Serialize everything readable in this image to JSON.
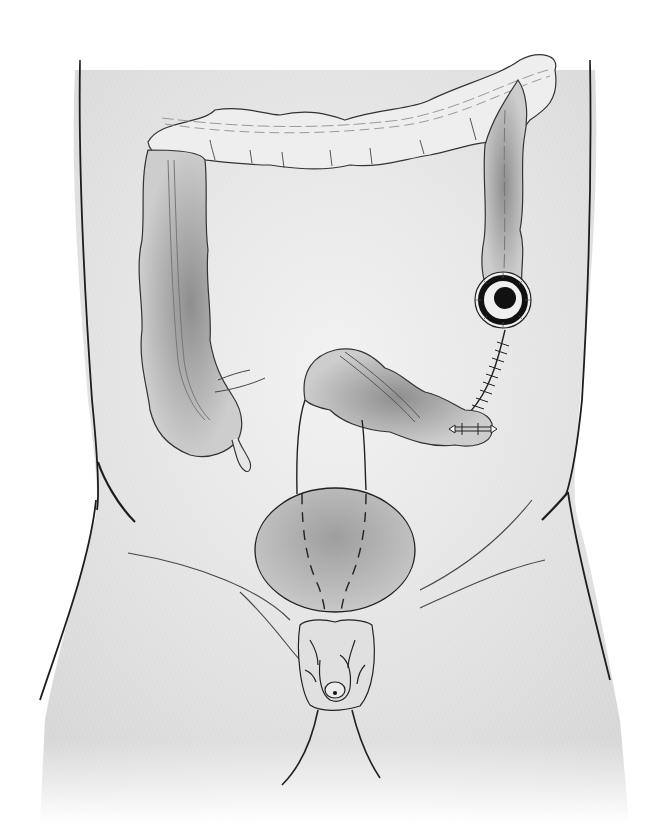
{
  "figure": {
    "type": "medical-illustration",
    "text_labels": [],
    "colors": {
      "background": "#ffffff",
      "skin": "#e4e4e4",
      "outline": "#1e1e1e",
      "organ_shadow": "#9a9a9a",
      "stoma_dark": "#111111",
      "bladder_fill": "#b9b9b9"
    },
    "parts": [
      {
        "id": "torso",
        "label": "Torso outline"
      },
      {
        "id": "transverse-colon",
        "label": "Transverse colon"
      },
      {
        "id": "ascending-colon",
        "label": "Ascending colon"
      },
      {
        "id": "descending-colon",
        "label": "Descending colon"
      },
      {
        "id": "appendix",
        "label": "Appendix"
      },
      {
        "id": "stoma",
        "label": "End colostomy stoma"
      },
      {
        "id": "suture-line",
        "label": "Suture line"
      },
      {
        "id": "sigmoid-colon",
        "label": "Sigmoid colon / rectal stump"
      },
      {
        "id": "staple-line",
        "label": "Staple line"
      },
      {
        "id": "bladder",
        "label": "Bladder"
      },
      {
        "id": "ureters",
        "label": "Ureters (dashed)"
      },
      {
        "id": "genitalia",
        "label": "External genitalia"
      },
      {
        "id": "inguinal-lines",
        "label": "Inguinal lines"
      }
    ]
  }
}
